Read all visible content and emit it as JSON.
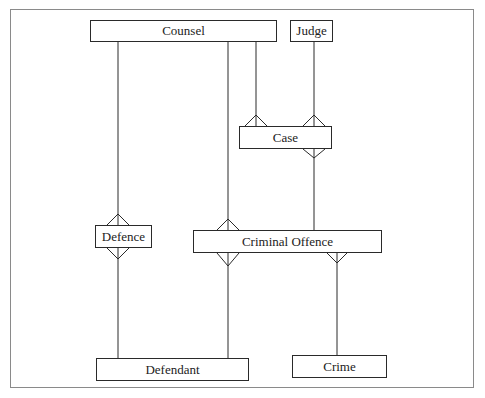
{
  "diagram": {
    "type": "entity-relationship",
    "notation": "crow's foot",
    "entities": [
      {
        "id": "counsel",
        "label": "Counsel",
        "x": 90,
        "y": 20,
        "w": 187,
        "h": 22
      },
      {
        "id": "judge",
        "label": "Judge",
        "x": 290,
        "y": 20,
        "w": 43,
        "h": 22
      },
      {
        "id": "case",
        "label": "Case",
        "x": 239,
        "y": 126,
        "w": 93,
        "h": 23
      },
      {
        "id": "defence",
        "label": "Defence",
        "x": 95,
        "y": 225,
        "w": 57,
        "h": 23
      },
      {
        "id": "criminal_offence",
        "label": "Criminal Offence",
        "x": 193,
        "y": 230,
        "w": 189,
        "h": 23
      },
      {
        "id": "defendant",
        "label": "Defendant",
        "x": 96,
        "y": 358,
        "w": 153,
        "h": 23
      },
      {
        "id": "crime",
        "label": "Crime",
        "x": 292,
        "y": 355,
        "w": 95,
        "h": 23
      }
    ],
    "relationships": [
      {
        "from": "Counsel",
        "to": "Case",
        "to_cardinality": "many"
      },
      {
        "from": "Judge",
        "to": "Case",
        "to_cardinality": "many"
      },
      {
        "from": "Counsel",
        "to": "Defence",
        "to_cardinality": "many"
      },
      {
        "from": "Counsel",
        "to": "Criminal Offence",
        "to_cardinality": "many"
      },
      {
        "from": "Case",
        "to": "Criminal Offence",
        "from_cardinality": "many"
      },
      {
        "from": "Defendant",
        "to": "Defence",
        "from_cardinality": "many"
      },
      {
        "from": "Defendant",
        "to": "Criminal Offence",
        "from_cardinality": "many"
      },
      {
        "from": "Crime",
        "to": "Criminal Offence",
        "from_cardinality": "many"
      }
    ]
  },
  "colors": {
    "line": "#2a2a2a",
    "frame": "#8a8a8a",
    "background": "#ffffff"
  }
}
